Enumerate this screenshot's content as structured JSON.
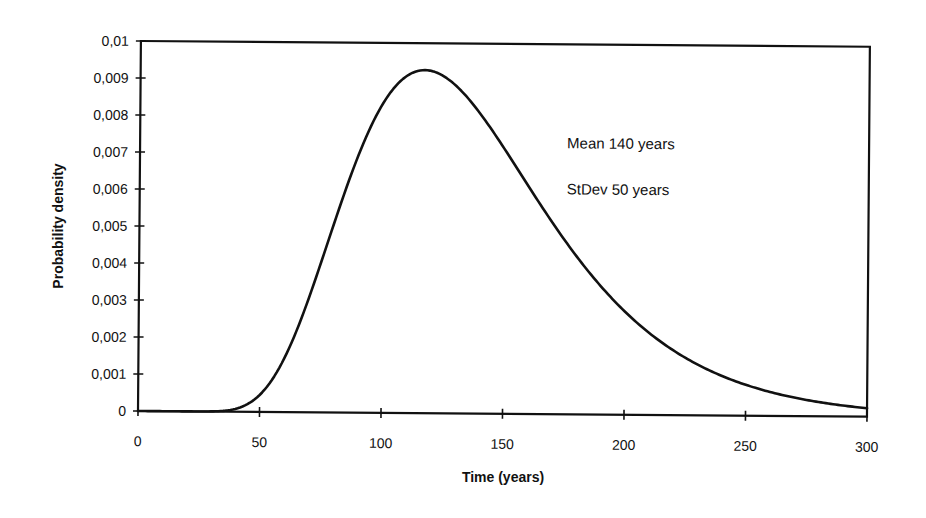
{
  "chart_data": {
    "type": "line",
    "title": "",
    "xlabel": "Time (years)",
    "ylabel": "Probability density",
    "xlim": [
      0,
      300
    ],
    "ylim": [
      0,
      0.01
    ],
    "x_ticks": [
      0,
      50,
      100,
      150,
      200,
      250,
      300
    ],
    "x_tick_labels": [
      "0",
      "50",
      "100",
      "150",
      "200",
      "250",
      "300"
    ],
    "y_ticks": [
      0,
      0.001,
      0.002,
      0.003,
      0.004,
      0.005,
      0.006,
      0.007,
      0.008,
      0.009,
      0.01
    ],
    "y_tick_labels": [
      "0",
      "0,001",
      "0,002",
      "0,003",
      "0,004",
      "0,005",
      "0,006",
      "0,007",
      "0,008",
      "0,009",
      "0,01"
    ],
    "grid": false,
    "legend": null,
    "annotations": [
      "Mean 140 years",
      "StDev 50 years"
    ],
    "series": [
      {
        "name": "Lognormal PDF (mean 140, sd 50)",
        "x": [
          0,
          20,
          30,
          35,
          40,
          45,
          50,
          60,
          70,
          75,
          80,
          90,
          100,
          110,
          117,
          125,
          140,
          150,
          160,
          175,
          190,
          200,
          225,
          250,
          275,
          300
        ],
        "values": [
          0,
          0.0,
          1e-05,
          4e-05,
          0.0001,
          0.00023,
          0.00046,
          0.00127,
          0.00263,
          0.00347,
          0.00438,
          0.00633,
          0.00814,
          0.00907,
          0.0092,
          0.00904,
          0.0081,
          0.00716,
          0.00622,
          0.00486,
          0.00368,
          0.003,
          0.00167,
          0.00084,
          0.00041,
          0.00023
        ]
      }
    ],
    "curve_params": {
      "distribution": "lognormal",
      "mean": 140,
      "stdev": 50
    }
  },
  "labels": {
    "annotation_mean": "Mean 140 years",
    "annotation_stdev": "StDev 50 years",
    "xlabel": "Time (years)",
    "ylabel": "Probability density"
  }
}
